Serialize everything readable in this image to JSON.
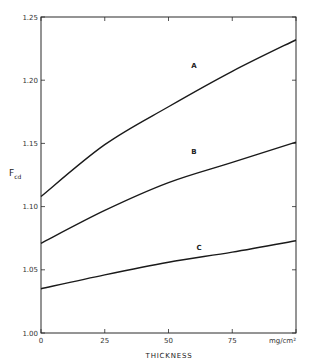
{
  "chart_data": {
    "type": "line",
    "title": "",
    "xlabel": "THICKNESS",
    "x_unit": "mg/cm²",
    "ylabel": "F",
    "ylabel_subscript": "cd",
    "xlim": [
      0,
      100
    ],
    "ylim": [
      1.0,
      1.25
    ],
    "grid": false,
    "legend": "inline labels on curves",
    "x_ticks": [
      0,
      25,
      50,
      75,
      100
    ],
    "x_tick_labels": [
      "0",
      "25",
      "50",
      "75",
      "mg/cm²"
    ],
    "y_ticks": [
      1.0,
      1.05,
      1.1,
      1.15,
      1.2,
      1.25
    ],
    "y_tick_labels": [
      "1.00",
      "1.05",
      "1.10",
      "1.15",
      "1.20",
      "1.25"
    ],
    "x": [
      0,
      25,
      50,
      75,
      100
    ],
    "series": [
      {
        "name": "A",
        "values": [
          1.108,
          1.149,
          1.179,
          1.207,
          1.232
        ],
        "label_at": [
          60,
          1.21
        ]
      },
      {
        "name": "B",
        "values": [
          1.071,
          1.097,
          1.119,
          1.135,
          1.151
        ],
        "label_at": [
          60,
          1.142
        ]
      },
      {
        "name": "C",
        "values": [
          1.035,
          1.046,
          1.056,
          1.064,
          1.073
        ],
        "label_at": [
          62,
          1.066
        ]
      }
    ]
  },
  "labels": {
    "xlabel": "THICKNESS",
    "ylabel_main": "F",
    "ylabel_sub": "cd"
  }
}
